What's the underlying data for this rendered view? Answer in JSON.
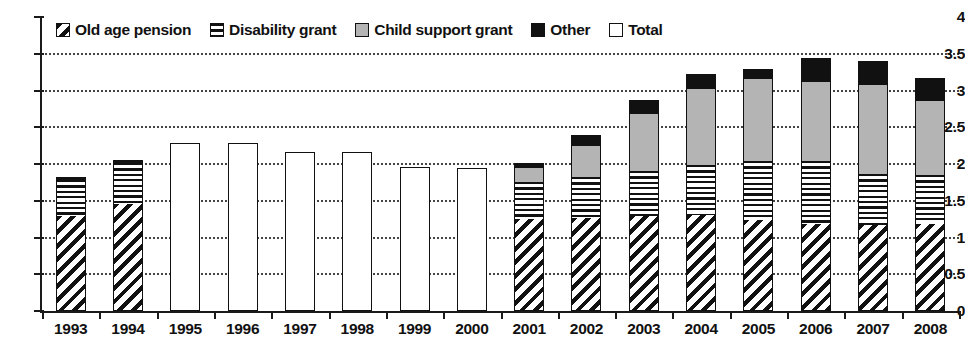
{
  "chart_data": {
    "type": "bar",
    "title": "",
    "subtitle": "",
    "xlabel": "",
    "ylabel": "",
    "ylim": [
      0,
      4
    ],
    "ytick_labels": [
      "4",
      "3.5",
      "3",
      "2.5",
      "2",
      "1.5",
      "1",
      "0.5",
      "0"
    ],
    "ytick_values": [
      4,
      3.5,
      3,
      2.5,
      2,
      1.5,
      1,
      0.5,
      0
    ],
    "grid": true,
    "grid_style": "dotted-horizontal",
    "legend_position": "top-inside",
    "stacked": true,
    "categories": [
      "1993",
      "1994",
      "1995",
      "1996",
      "1997",
      "1998",
      "1999",
      "2000",
      "2001",
      "2002",
      "2003",
      "2004",
      "2005",
      "2006",
      "2007",
      "2008"
    ],
    "series": [
      {
        "name": "Old age pension",
        "pattern": "diagonal-hatch",
        "values": [
          1.29,
          1.45,
          null,
          null,
          null,
          null,
          null,
          null,
          1.25,
          1.27,
          1.29,
          1.3,
          1.24,
          1.18,
          1.17,
          1.18
        ]
      },
      {
        "name": "Disability grant",
        "pattern": "horizontal-lines",
        "values": [
          0.49,
          0.57,
          null,
          null,
          null,
          null,
          null,
          null,
          0.5,
          0.55,
          0.62,
          0.68,
          0.8,
          0.86,
          0.7,
          0.67
        ]
      },
      {
        "name": "Child support grant",
        "pattern": "solid-gray",
        "values": [
          0.0,
          0.0,
          null,
          null,
          null,
          null,
          null,
          null,
          0.2,
          0.43,
          0.77,
          1.04,
          1.11,
          1.07,
          1.21,
          1.01
        ]
      },
      {
        "name": "Other",
        "pattern": "solid-black",
        "values": [
          0.04,
          0.03,
          null,
          null,
          null,
          null,
          null,
          null,
          0.07,
          0.14,
          0.19,
          0.2,
          0.14,
          0.33,
          0.32,
          0.31
        ]
      },
      {
        "name": "Total",
        "pattern": "empty-outline",
        "values": [
          null,
          null,
          2.28,
          2.28,
          2.17,
          2.17,
          1.96,
          1.95,
          null,
          null,
          null,
          null,
          null,
          null,
          null,
          null
        ]
      }
    ],
    "totals": [
      1.82,
      2.05,
      2.28,
      2.28,
      2.17,
      2.17,
      1.96,
      1.95,
      2.02,
      2.39,
      2.87,
      3.22,
      3.29,
      3.44,
      3.4,
      3.17
    ]
  },
  "legend": {
    "items": [
      {
        "label": "Old age pension",
        "swatch": "diagonal-hatch-swatch",
        "color": "#111111"
      },
      {
        "label": "Disability grant",
        "swatch": "horizontal-lines-swatch",
        "color": "#111111"
      },
      {
        "label": "Child support grant",
        "swatch": "gray-swatch",
        "color": "#b4b4b4"
      },
      {
        "label": "Other",
        "swatch": "black-swatch",
        "color": "#111111"
      },
      {
        "label": "Total",
        "swatch": "white-swatch",
        "color": "#ffffff"
      }
    ]
  }
}
